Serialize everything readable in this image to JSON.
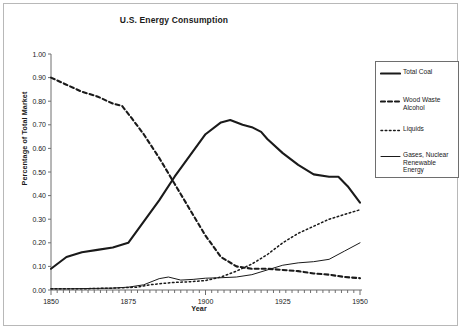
{
  "chart_data": {
    "type": "line",
    "title": "U.S. Energy Consumption",
    "xlabel": "Year",
    "ylabel": "Percentage of Total Market",
    "xlim": [
      1850,
      1950
    ],
    "ylim": [
      0.0,
      1.0
    ],
    "grid": false,
    "legend_position": "right",
    "xticks": [
      "1850",
      "1875",
      "1900",
      "1925",
      "1950"
    ],
    "xtick_values": [
      1850,
      1875,
      1900,
      1925,
      1950
    ],
    "xminor_step": 2,
    "yticks": [
      "0.00",
      "0.10",
      "0.20",
      "0.30",
      "0.40",
      "0.50",
      "0.60",
      "0.70",
      "0.80",
      "0.90",
      "1.00"
    ],
    "ytick_values": [
      0.0,
      0.1,
      0.2,
      0.3,
      0.4,
      0.5,
      0.6,
      0.7,
      0.8,
      0.9,
      1.0
    ],
    "series": [
      {
        "name": "Total Coal",
        "style": "solid-thick",
        "x": [
          1850,
          1855,
          1860,
          1865,
          1870,
          1875,
          1880,
          1885,
          1890,
          1895,
          1900,
          1905,
          1908,
          1912,
          1915,
          1918,
          1920,
          1925,
          1930,
          1935,
          1940,
          1943,
          1946,
          1950
        ],
        "values": [
          0.09,
          0.14,
          0.16,
          0.17,
          0.18,
          0.2,
          0.29,
          0.38,
          0.48,
          0.57,
          0.66,
          0.71,
          0.72,
          0.7,
          0.69,
          0.67,
          0.64,
          0.58,
          0.53,
          0.49,
          0.48,
          0.48,
          0.44,
          0.37
        ]
      },
      {
        "name": "Wood Waste Alcohol",
        "style": "dashed-thick",
        "x": [
          1850,
          1855,
          1860,
          1865,
          1870,
          1873,
          1876,
          1880,
          1885,
          1890,
          1895,
          1900,
          1905,
          1910,
          1915,
          1920,
          1925,
          1930,
          1935,
          1940,
          1945,
          1950
        ],
        "values": [
          0.9,
          0.87,
          0.84,
          0.82,
          0.79,
          0.78,
          0.73,
          0.66,
          0.56,
          0.45,
          0.34,
          0.23,
          0.14,
          0.1,
          0.09,
          0.09,
          0.085,
          0.08,
          0.07,
          0.065,
          0.055,
          0.05
        ]
      },
      {
        "name": "Liquids",
        "style": "dotted-thin",
        "x": [
          1850,
          1860,
          1870,
          1878,
          1882,
          1886,
          1890,
          1895,
          1900,
          1905,
          1910,
          1915,
          1920,
          1925,
          1930,
          1935,
          1940,
          1945,
          1950
        ],
        "values": [
          0.005,
          0.005,
          0.008,
          0.012,
          0.022,
          0.028,
          0.032,
          0.035,
          0.04,
          0.055,
          0.08,
          0.11,
          0.15,
          0.2,
          0.24,
          0.27,
          0.3,
          0.32,
          0.34
        ]
      },
      {
        "name": "Gases, Nuclear Renewable Energy",
        "style": "solid-thin",
        "x": [
          1850,
          1855,
          1860,
          1865,
          1870,
          1875,
          1880,
          1885,
          1888,
          1892,
          1896,
          1900,
          1905,
          1910,
          1915,
          1920,
          1925,
          1930,
          1935,
          1940,
          1945,
          1950
        ],
        "values": [
          0.005,
          0.005,
          0.006,
          0.007,
          0.008,
          0.012,
          0.022,
          0.048,
          0.055,
          0.042,
          0.045,
          0.05,
          0.052,
          0.055,
          0.065,
          0.085,
          0.105,
          0.115,
          0.12,
          0.13,
          0.165,
          0.2
        ]
      }
    ],
    "legend": [
      {
        "label": "Total Coal",
        "style": "solid-thick"
      },
      {
        "label": "Wood Waste Alcohol",
        "style": "dashed-thick"
      },
      {
        "label": "Liquids",
        "style": "dotted-thin"
      },
      {
        "label": "Gases, Nuclear Renewable Energy",
        "style": "solid-thin"
      }
    ],
    "colors": {
      "line": "#1a1a1a",
      "axis": "#6e6e6e",
      "frame": "#b8b8b8"
    }
  }
}
